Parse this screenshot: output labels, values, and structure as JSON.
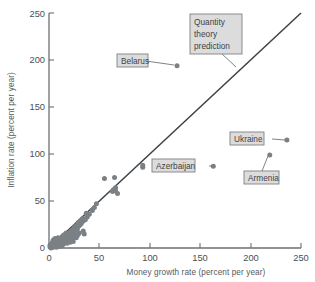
{
  "chart_data": {
    "type": "scatter",
    "title": "",
    "xlabel": "Money growth rate (percent per year)",
    "ylabel": "Inflation rate (percent per year)",
    "xlim": [
      0,
      250
    ],
    "ylim": [
      0,
      250
    ],
    "xticks": [
      0,
      50,
      100,
      150,
      200,
      250
    ],
    "yticks": [
      0,
      50,
      100,
      150,
      200,
      250
    ],
    "grid": false,
    "legend": "none",
    "reference_line": {
      "label": "Quantity theory prediction",
      "slope": 1,
      "intercept": 0,
      "from": [
        0,
        0
      ],
      "to": [
        250,
        250
      ]
    },
    "annotations": [
      {
        "label": "Belarus",
        "x": 127,
        "y": 194,
        "box_x": 96,
        "box_y": 196
      },
      {
        "label": "Azerbaijan",
        "x": 163,
        "y": 87,
        "box_x": 118,
        "box_y": 88
      },
      {
        "label": "Ukraine",
        "x": 236,
        "y": 115,
        "box_x": 196,
        "box_y": 117
      },
      {
        "label": "Armenia",
        "x": 219,
        "y": 99,
        "box_x": 205,
        "box_y": 74
      },
      {
        "label": "Quantity theory prediction",
        "x": 186,
        "y": 186,
        "box_x": 140,
        "box_y": 232
      }
    ],
    "points": [
      [
        127,
        194
      ],
      [
        163,
        87
      ],
      [
        236,
        115
      ],
      [
        219,
        99
      ],
      [
        93,
        88
      ],
      [
        93,
        86
      ],
      [
        55,
        74
      ],
      [
        65,
        75
      ],
      [
        66,
        64
      ],
      [
        66,
        61
      ],
      [
        68,
        58
      ],
      [
        63,
        60
      ],
      [
        64,
        62
      ],
      [
        47,
        47
      ],
      [
        45,
        43
      ],
      [
        43,
        40
      ],
      [
        40,
        36
      ],
      [
        38,
        33
      ],
      [
        37,
        37
      ],
      [
        36,
        30
      ],
      [
        35,
        31
      ],
      [
        34,
        29
      ],
      [
        33,
        28
      ],
      [
        33,
        31
      ],
      [
        32,
        26
      ],
      [
        31,
        25
      ],
      [
        31,
        29
      ],
      [
        30,
        24
      ],
      [
        29,
        23
      ],
      [
        29,
        27
      ],
      [
        28,
        22
      ],
      [
        28,
        20
      ],
      [
        27,
        24
      ],
      [
        27,
        21
      ],
      [
        26,
        19
      ],
      [
        26,
        23
      ],
      [
        25,
        18
      ],
      [
        25,
        22
      ],
      [
        24,
        20
      ],
      [
        24,
        17
      ],
      [
        23,
        19
      ],
      [
        23,
        16
      ],
      [
        34,
        18
      ],
      [
        35,
        15
      ],
      [
        30,
        16
      ],
      [
        22,
        18
      ],
      [
        22,
        15
      ],
      [
        21,
        17
      ],
      [
        21,
        14
      ],
      [
        20,
        16
      ],
      [
        20,
        13
      ],
      [
        19,
        15
      ],
      [
        19,
        12
      ],
      [
        18,
        14
      ],
      [
        18,
        11
      ],
      [
        17,
        13
      ],
      [
        17,
        16
      ],
      [
        16,
        12
      ],
      [
        16,
        10
      ],
      [
        15,
        14
      ],
      [
        15,
        11
      ],
      [
        15,
        9
      ],
      [
        14,
        13
      ],
      [
        14,
        10
      ],
      [
        14,
        8
      ],
      [
        13,
        12
      ],
      [
        13,
        9
      ],
      [
        13,
        7
      ],
      [
        12,
        11
      ],
      [
        12,
        8
      ],
      [
        12,
        6
      ],
      [
        11,
        10
      ],
      [
        11,
        7
      ],
      [
        11,
        5
      ],
      [
        10,
        9
      ],
      [
        10,
        6
      ],
      [
        10,
        4
      ],
      [
        9,
        8
      ],
      [
        9,
        5
      ],
      [
        9,
        11
      ],
      [
        8,
        7
      ],
      [
        8,
        4
      ],
      [
        8,
        10
      ],
      [
        7,
        6
      ],
      [
        7,
        3
      ],
      [
        7,
        9
      ],
      [
        6,
        5
      ],
      [
        6,
        8
      ],
      [
        6,
        2
      ],
      [
        5,
        4
      ],
      [
        5,
        7
      ],
      [
        5,
        2
      ],
      [
        4,
        3
      ],
      [
        4,
        6
      ],
      [
        4,
        1
      ],
      [
        3,
        2
      ],
      [
        3,
        5
      ],
      [
        3,
        1
      ],
      [
        2,
        2
      ],
      [
        2,
        4
      ],
      [
        2,
        0
      ],
      [
        1,
        1
      ],
      [
        1,
        3
      ],
      [
        16,
        6
      ],
      [
        17,
        8
      ],
      [
        18,
        5
      ],
      [
        19,
        7
      ],
      [
        20,
        9
      ],
      [
        21,
        6
      ],
      [
        22,
        8
      ],
      [
        23,
        10
      ],
      [
        24,
        7
      ],
      [
        15,
        5
      ],
      [
        14,
        4
      ],
      [
        13,
        3
      ],
      [
        12,
        2
      ],
      [
        11,
        3
      ],
      [
        10,
        2
      ],
      [
        9,
        2
      ],
      [
        8,
        1
      ],
      [
        7,
        1
      ],
      [
        6,
        10
      ],
      [
        5,
        9
      ],
      [
        4,
        8
      ],
      [
        25,
        12
      ],
      [
        26,
        14
      ],
      [
        27,
        11
      ],
      [
        28,
        13
      ],
      [
        29,
        15
      ],
      [
        20,
        11
      ],
      [
        19,
        9
      ],
      [
        18,
        8
      ],
      [
        17,
        10
      ],
      [
        16,
        8
      ],
      [
        15,
        7
      ],
      [
        14,
        6
      ],
      [
        13,
        5
      ],
      [
        12,
        4
      ],
      [
        11,
        8
      ],
      [
        10,
        7
      ],
      [
        9,
        6
      ],
      [
        8,
        5
      ],
      [
        7,
        4
      ],
      [
        6,
        3
      ],
      [
        5,
        1
      ],
      [
        24,
        13
      ],
      [
        23,
        12
      ],
      [
        22,
        11
      ]
    ]
  },
  "yaxis": {
    "label": "Inflation rate (percent per year)",
    "ticks": [
      "0",
      "50",
      "100",
      "150",
      "200",
      "250"
    ]
  },
  "xaxis": {
    "label": "Money growth rate (percent per year)",
    "ticks": [
      "0",
      "50",
      "100",
      "150",
      "200",
      "250"
    ]
  },
  "callouts": {
    "quantity_theory_l1": "Quantity",
    "quantity_theory_l2": "theory",
    "quantity_theory_l3": "prediction",
    "belarus": "Belarus",
    "azerbaijan": "Azerbaijan",
    "ukraine": "Ukraine",
    "armenia": "Armenia"
  },
  "colors": {
    "point": "#7b8084",
    "axis": "#6b7074",
    "line": "#3c4044",
    "box_fill": "#dcdcdc",
    "box_stroke": "#7d8185",
    "text": "#3e4347",
    "background": "#ffffff"
  }
}
